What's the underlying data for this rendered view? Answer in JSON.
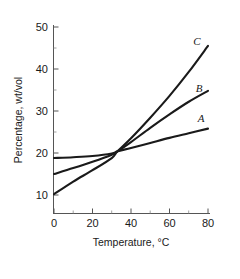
{
  "chart_data": {
    "type": "line",
    "title": "",
    "xlabel": "Temperature, °C",
    "ylabel": "Percentage, wt/vol",
    "xlim": [
      0,
      80
    ],
    "ylim": [
      5,
      50
    ],
    "xticks": [
      0,
      20,
      40,
      60,
      80
    ],
    "xtick_labels": [
      "0",
      "20",
      "40",
      "60",
      "80"
    ],
    "xminor_ticks": [
      10,
      30,
      50,
      70
    ],
    "yticks": [
      10,
      20,
      30,
      40,
      50
    ],
    "ytick_labels": [
      "10",
      "20",
      "30",
      "40",
      "50"
    ],
    "yminor_ticks": [
      15,
      25,
      35,
      45
    ],
    "grid": false,
    "legend_position": "inline-right-end",
    "series": [
      {
        "name": "A",
        "label": "A",
        "color": "#1a1a1a",
        "x": [
          0,
          10,
          20,
          30,
          33,
          40,
          50,
          60,
          70,
          80
        ],
        "values": [
          18.8,
          19.0,
          19.3,
          19.9,
          20.4,
          21.2,
          22.4,
          23.6,
          24.7,
          25.8
        ]
      },
      {
        "name": "B",
        "label": "B",
        "color": "#1a1a1a",
        "x": [
          0,
          10,
          20,
          30,
          33,
          40,
          50,
          60,
          70,
          80
        ],
        "values": [
          15.0,
          16.4,
          17.9,
          19.6,
          20.4,
          22.6,
          26.0,
          29.2,
          32.2,
          34.8
        ]
      },
      {
        "name": "C",
        "label": "C",
        "color": "#1a1a1a",
        "x": [
          0,
          10,
          20,
          30,
          33,
          40,
          50,
          60,
          70,
          80
        ],
        "values": [
          10.2,
          13.2,
          15.9,
          18.8,
          20.4,
          23.5,
          28.4,
          33.6,
          39.3,
          45.5
        ]
      }
    ]
  },
  "axes": {
    "x_title": "Temperature, °C",
    "y_title": "Percentage, wt/vol",
    "x_tick_labels": [
      "0",
      "20",
      "40",
      "60",
      "80"
    ],
    "y_tick_labels": [
      "10",
      "20",
      "30",
      "40",
      "50"
    ]
  },
  "series_labels": {
    "a": "A",
    "b": "B",
    "c": "C"
  },
  "colors": {
    "curve": "#1a1a1a",
    "axis": "#555555",
    "background": "#ffffff"
  }
}
